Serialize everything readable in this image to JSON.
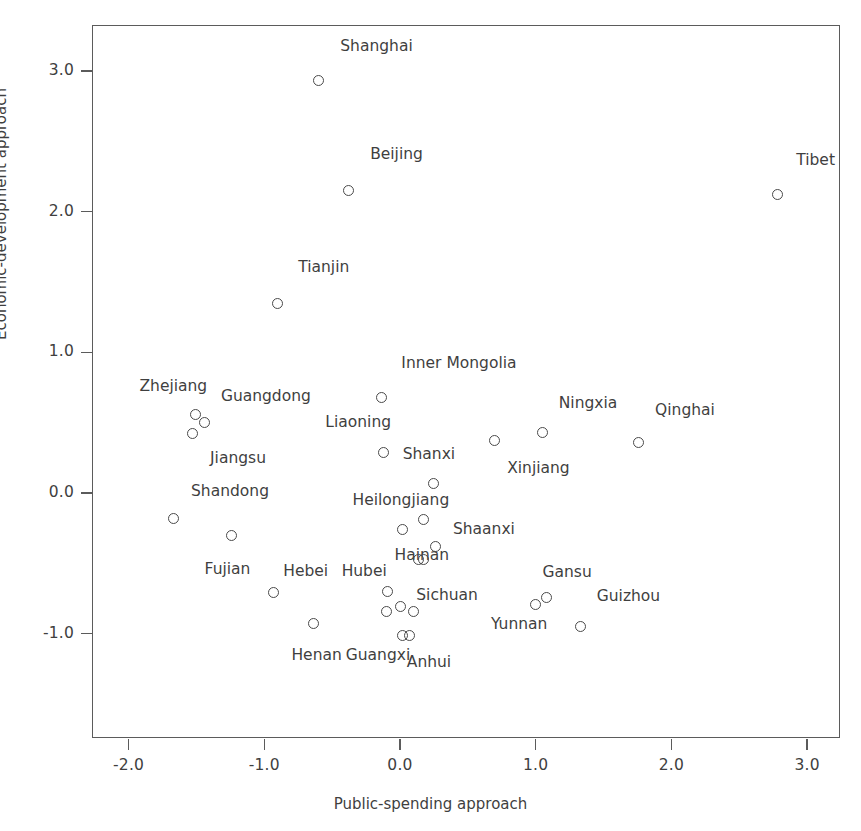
{
  "chart_data": {
    "type": "scatter",
    "title": "",
    "xlabel": "Public-spending approach",
    "ylabel": "Economic-development approach",
    "xlim": [
      -2.25,
      3.26
    ],
    "ylim": [
      -1.75,
      3.32
    ],
    "xticks": [
      "-2.0",
      "-1.0",
      "0.0",
      "1.0",
      "2.0",
      "3.0"
    ],
    "xtick_values": [
      -2.0,
      -1.0,
      0.0,
      1.0,
      2.0,
      3.0
    ],
    "yticks": [
      "3.0",
      "2.0",
      "1.0",
      "0.0",
      "-1.0"
    ],
    "ytick_values": [
      3.0,
      2.0,
      1.0,
      0.0,
      -1.0
    ],
    "grid": false,
    "legend": null,
    "marker": "open-circle",
    "points": [
      {
        "label": "Shanghai",
        "x": -0.6,
        "y": 2.93,
        "lx": -0.44,
        "ly": 3.17
      },
      {
        "label": "Beijing",
        "x": -0.38,
        "y": 2.15,
        "lx": -0.22,
        "ly": 2.4
      },
      {
        "label": "Tibet",
        "x": 2.78,
        "y": 2.12,
        "lx": 2.92,
        "ly": 2.36
      },
      {
        "label": "Tianjin",
        "x": -0.9,
        "y": 1.35,
        "lx": -0.75,
        "ly": 1.6
      },
      {
        "label": "Inner Mongolia",
        "x": -0.14,
        "y": 0.68,
        "lx": 0.01,
        "ly": 0.92
      },
      {
        "label": "Zhejiang",
        "x": -1.51,
        "y": 0.56,
        "lx": -1.92,
        "ly": 0.75
      },
      {
        "label": "Guangdong",
        "x": -1.44,
        "y": 0.5,
        "lx": -1.32,
        "ly": 0.68
      },
      {
        "label": "Jiangsu",
        "x": -1.53,
        "y": 0.42,
        "lx": -1.4,
        "ly": 0.24
      },
      {
        "label": "Ningxia",
        "x": 1.05,
        "y": 0.43,
        "lx": 1.17,
        "ly": 0.63
      },
      {
        "label": "Qinghai",
        "x": 1.76,
        "y": 0.36,
        "lx": 1.88,
        "ly": 0.58
      },
      {
        "label": "Xinjiang",
        "x": 0.7,
        "y": 0.37,
        "lx": 0.79,
        "ly": 0.17
      },
      {
        "label": "Liaoning",
        "x": -0.12,
        "y": 0.29,
        "lx": -0.55,
        "ly": 0.5
      },
      {
        "label": "Shanxi",
        "x": 0.25,
        "y": 0.07,
        "lx": 0.02,
        "ly": 0.27
      },
      {
        "label": "Shandong",
        "x": -1.67,
        "y": -0.18,
        "lx": -1.54,
        "ly": 0.01
      },
      {
        "label": "Heilongjiang",
        "x": 0.17,
        "y": -0.19,
        "lx": -0.35,
        "ly": -0.06
      },
      {
        "label": "Hainan",
        "x": 0.02,
        "y": -0.26,
        "lx": -0.04,
        "ly": -0.45
      },
      {
        "label": "Shaanxi",
        "x": 0.26,
        "y": -0.38,
        "lx": 0.39,
        "ly": -0.26
      },
      {
        "label": "Fujian",
        "x": -1.24,
        "y": -0.3,
        "lx": -1.44,
        "ly": -0.55
      },
      {
        "label": "Sichuan",
        "x": 0.14,
        "y": -0.47,
        "lx": 0.12,
        "ly": -0.73
      },
      {
        "label": "Hubei",
        "x": 0.17,
        "y": -0.47,
        "lx": -0.43,
        "ly": -0.56
      },
      {
        "label": "Hebei",
        "x": -0.93,
        "y": -0.71,
        "lx": -0.86,
        "ly": -0.56
      },
      {
        "label": "Henan",
        "x": -0.64,
        "y": -0.93,
        "lx": -0.8,
        "ly": -1.16
      },
      {
        "label": "Guangxi",
        "x": -0.1,
        "y": -0.84,
        "lx": -0.4,
        "ly": -1.16
      },
      {
        "label": "Anhui",
        "x": 0.07,
        "y": -1.01,
        "lx": 0.05,
        "ly": -1.21
      },
      {
        "label": "Gansu",
        "x": 1.0,
        "y": -0.79,
        "lx": 1.05,
        "ly": -0.57
      },
      {
        "label": "Yunnan",
        "x": 1.08,
        "y": -0.74,
        "lx": 0.67,
        "ly": -0.94
      },
      {
        "label": "Guizhou",
        "x": 1.33,
        "y": -0.95,
        "lx": 1.45,
        "ly": -0.74
      },
      {
        "label": "_p1",
        "x": -0.09,
        "y": -0.7,
        "lx": null,
        "ly": null
      },
      {
        "label": "_p2",
        "x": 0.0,
        "y": -0.81,
        "lx": null,
        "ly": null
      },
      {
        "label": "_p3",
        "x": 0.1,
        "y": -0.84,
        "lx": null,
        "ly": null
      },
      {
        "label": "_p4",
        "x": 0.02,
        "y": -1.01,
        "lx": null,
        "ly": null
      }
    ]
  },
  "axes": {
    "x_label": "Public-spending approach",
    "y_label": "Economic-development approach"
  },
  "style": {
    "frame_color": "#5b5b5b",
    "marker_color": "#4a4a4a",
    "text_color": "#3f3f3f",
    "background": "#ffffff"
  }
}
